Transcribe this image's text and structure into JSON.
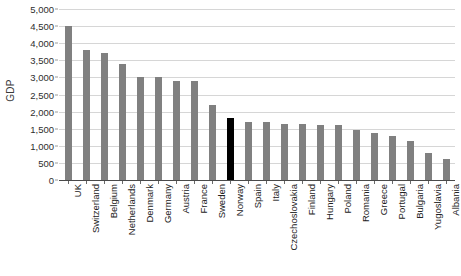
{
  "chart_data": {
    "type": "bar",
    "title": "",
    "xlabel": "",
    "ylabel": "GDP",
    "ylim": [
      0,
      5000
    ],
    "ytick_step": 500,
    "grid": true,
    "legend": "none",
    "ytick_labels": [
      "0",
      "500",
      "1,000",
      "1,500",
      "2,000",
      "2,500",
      "3,000",
      "3,500",
      "4,000",
      "4,500",
      "5,000"
    ],
    "ytick_values": [
      0,
      500,
      1000,
      1500,
      2000,
      2500,
      3000,
      3500,
      4000,
      4500,
      5000
    ],
    "categories": [
      "UK",
      "Switzerland",
      "Belgium",
      "Netherlands",
      "Denmark",
      "Germany",
      "Austria",
      "France",
      "Sweden",
      "Norway",
      "Spain",
      "Italy",
      "Czechoslovakia",
      "Finland",
      "Hungary",
      "Poland",
      "Romania",
      "Greece",
      "Portugal",
      "Bulgaria",
      "Yugoslavia",
      "Albania"
    ],
    "values": [
      4500,
      3800,
      3700,
      3400,
      3000,
      3000,
      2900,
      2900,
      2200,
      1800,
      1700,
      1700,
      1650,
      1650,
      1620,
      1600,
      1450,
      1380,
      1300,
      1150,
      800,
      600
    ],
    "highlight_category": "Norway",
    "colors": {
      "bar": "#808080",
      "bar_highlight": "#000000",
      "gridline": "#d6d6d6",
      "axis": "#4a4a4a",
      "text": "#222222",
      "background": "#ffffff"
    }
  }
}
